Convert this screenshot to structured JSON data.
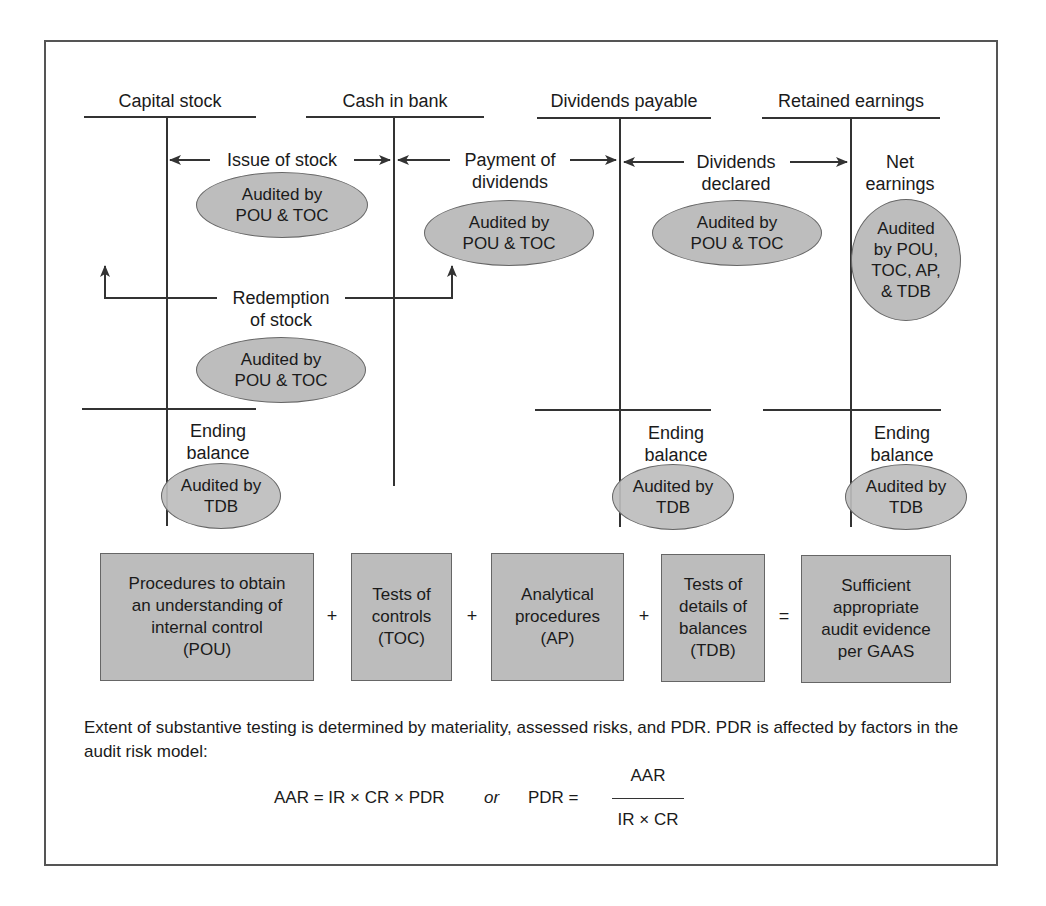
{
  "accounts": [
    {
      "title": "Capital stock"
    },
    {
      "title": "Cash in bank"
    },
    {
      "title": "Dividends payable"
    },
    {
      "title": "Retained earnings"
    }
  ],
  "flows": {
    "issue_of_stock": "Issue of stock",
    "payment_of_dividends_line1": "Payment of",
    "payment_of_dividends_line2": "dividends",
    "dividends_declared_line1": "Dividends",
    "dividends_declared_line2": "declared",
    "net_earnings_line1": "Net",
    "net_earnings_line2": "earnings",
    "redemption_line1": "Redemption",
    "redemption_line2": "of stock"
  },
  "audit_ovals": {
    "issue_of_stock": "Audited by\nPOU & TOC",
    "payment_of_dividends": "Audited by\nPOU & TOC",
    "dividends_declared": "Audited by\nPOU & TOC",
    "net_earnings": "Audited\nby POU,\nTOC, AP,\n& TDB",
    "redemption": "Audited by\nPOU & TOC",
    "ending_capital": "Audited by\nTDB",
    "ending_dividends": "Audited by\nTDB",
    "ending_retained": "Audited by\nTDB"
  },
  "ending_balance": {
    "line1": "Ending",
    "line2": "balance"
  },
  "equation": {
    "boxes": [
      "Procedures to obtain\nan understanding of\ninternal control\n(POU)",
      "Tests of\ncontrols\n(TOC)",
      "Analytical\nprocedures\n(AP)",
      "Tests of\ndetails of\nbalances\n(TDB)",
      "Sufficient\nappropriate\naudit evidence\nper GAAS"
    ],
    "operators": [
      "+",
      "+",
      "+",
      "="
    ]
  },
  "footnote": {
    "paragraph": "Extent of substantive testing is determined by materiality, assessed risks, and PDR. PDR is affected by factors in the audit risk model:",
    "formula_left": "AAR = IR × CR × PDR",
    "formula_or": "or",
    "formula_right_lhs": "PDR =",
    "fraction_numerator": "AAR",
    "fraction_denominator": "IR × CR"
  },
  "colors": {
    "fill_gray": "#bdbdbd",
    "line": "#333333",
    "frame": "#555555"
  }
}
